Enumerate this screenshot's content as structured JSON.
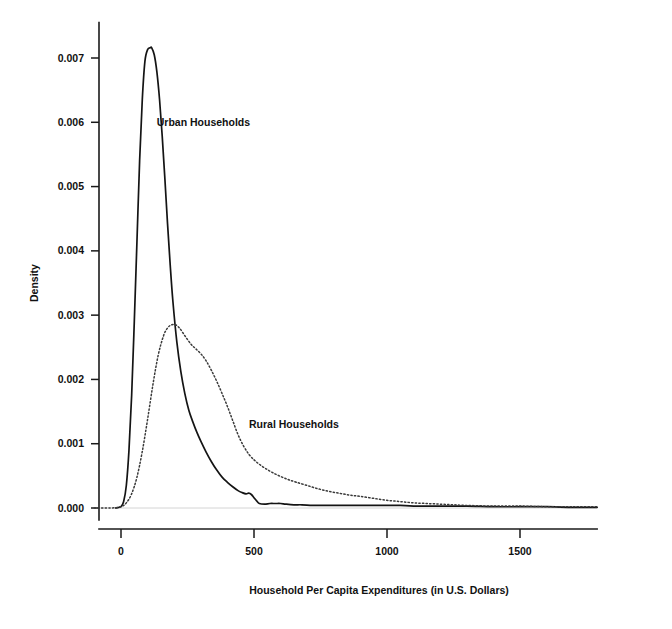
{
  "chart_data": {
    "type": "line",
    "title": "",
    "xlabel": "Household Per Capita Expenditures (in U.S. Dollars)",
    "ylabel": "Density",
    "xlim": [
      -120,
      1800
    ],
    "ylim": [
      0,
      0.0075
    ],
    "xticks": [
      0,
      500,
      1000,
      1500
    ],
    "xticklabels": [
      "0",
      "500",
      "1000",
      "1500"
    ],
    "yticks": [
      0.0,
      0.001,
      0.002,
      0.003,
      0.004,
      0.005,
      0.006,
      0.007
    ],
    "yticklabels": [
      "0.000",
      "0.001",
      "0.002",
      "0.003",
      "0.004",
      "0.005",
      "0.006",
      "0.007"
    ],
    "grid": false,
    "legend_position": "inline-annotation",
    "annotations": [
      {
        "text": "Urban Households",
        "x": 310,
        "y": 0.00595,
        "name": "urban-households-label"
      },
      {
        "text": "Rural Households",
        "x": 650,
        "y": 0.00125,
        "name": "rural-households-label"
      }
    ],
    "series": [
      {
        "name": "Urban Households",
        "style": "solid",
        "color": "#141414",
        "peak_x": 115,
        "peak_y": 0.00716,
        "x": [
          -20,
          0,
          10,
          20,
          30,
          40,
          50,
          60,
          70,
          80,
          90,
          100,
          110,
          115,
          125,
          135,
          145,
          155,
          165,
          175,
          185,
          195,
          210,
          225,
          240,
          255,
          270,
          285,
          300,
          320,
          340,
          360,
          380,
          400,
          420,
          440,
          455,
          470,
          480,
          490,
          500,
          510,
          520,
          540,
          560,
          580,
          600,
          620,
          650,
          680,
          720,
          760,
          800,
          850,
          900,
          950,
          1000,
          1050,
          1100,
          1200,
          1300,
          1400,
          1500,
          1600,
          1700,
          1790
        ],
        "y": [
          0.0,
          2e-05,
          0.0001,
          0.00035,
          0.0009,
          0.00175,
          0.0029,
          0.00415,
          0.0054,
          0.00635,
          0.00695,
          0.00713,
          0.00716,
          0.00716,
          0.00705,
          0.00678,
          0.00635,
          0.00578,
          0.00512,
          0.00442,
          0.00378,
          0.00322,
          0.00258,
          0.00212,
          0.00178,
          0.00152,
          0.00134,
          0.00118,
          0.00104,
          0.00087,
          0.00072,
          0.00059,
          0.00048,
          0.0004,
          0.00033,
          0.00027,
          0.00024,
          0.00022,
          0.00023,
          0.00021,
          0.00016,
          0.00011,
          7e-05,
          6e-05,
          7e-05,
          7e-05,
          7e-05,
          6e-05,
          5e-05,
          5e-05,
          4e-05,
          4e-05,
          4e-05,
          4e-05,
          4e-05,
          4e-05,
          4e-05,
          4e-05,
          3e-05,
          3e-05,
          3e-05,
          2e-05,
          2e-05,
          2e-05,
          1e-05,
          1e-05
        ]
      },
      {
        "name": "Rural Households",
        "style": "dotted",
        "color": "#3a3a3a",
        "peak_x": 205,
        "peak_y": 0.00285,
        "x": [
          -100,
          -40,
          0,
          20,
          40,
          60,
          80,
          100,
          120,
          140,
          160,
          175,
          190,
          205,
          220,
          235,
          250,
          265,
          280,
          300,
          320,
          340,
          360,
          380,
          400,
          420,
          440,
          460,
          480,
          500,
          520,
          545,
          570,
          600,
          630,
          660,
          700,
          740,
          780,
          820,
          860,
          900,
          950,
          1000,
          1050,
          1100,
          1150,
          1200,
          1250,
          1300,
          1400,
          1500,
          1600,
          1700,
          1790
        ],
        "y": [
          0.0,
          0.0,
          2e-05,
          8e-05,
          0.00022,
          0.00048,
          0.00088,
          0.00138,
          0.00192,
          0.00238,
          0.00268,
          0.0028,
          0.00285,
          0.00285,
          0.0028,
          0.00271,
          0.00262,
          0.00254,
          0.00248,
          0.0024,
          0.00229,
          0.00214,
          0.00197,
          0.00178,
          0.00158,
          0.00136,
          0.00114,
          0.00097,
          0.00084,
          0.00075,
          0.00068,
          0.00061,
          0.00055,
          0.00049,
          0.00044,
          0.0004,
          0.00035,
          0.0003,
          0.00026,
          0.00023,
          0.0002,
          0.00018,
          0.00015,
          0.00012,
          0.0001,
          8e-05,
          7e-05,
          6e-05,
          5e-05,
          4e-05,
          3e-05,
          3e-05,
          2e-05,
          2e-05,
          2e-05
        ]
      }
    ]
  }
}
